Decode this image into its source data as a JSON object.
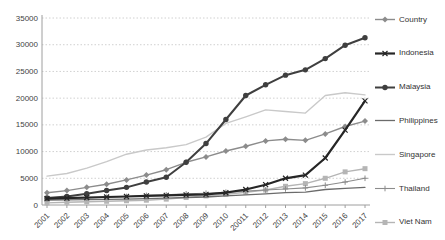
{
  "chart_data": {
    "type": "line",
    "title": "",
    "xlabel": "",
    "ylabel": "",
    "categories": [
      "2001",
      "2002",
      "2003",
      "2004",
      "2005",
      "2006",
      "2007",
      "2008",
      "2009",
      "2010",
      "20011",
      "2012",
      "2013",
      "2014",
      "2015",
      "2016",
      "2017"
    ],
    "yticks": [
      "0",
      "5000",
      "10000",
      "15000",
      "20000",
      "25000",
      "30000",
      "35000"
    ],
    "ylim": [
      0,
      35000
    ],
    "ytick_step": 5000,
    "grid": "horizontal-dotted",
    "legend_position": "right",
    "series": [
      {
        "name": "Country",
        "marker": "diamond",
        "color": "#8c8c8c",
        "width": 1.4,
        "values": [
          2300,
          2700,
          3300,
          3900,
          4700,
          5600,
          6600,
          8000,
          9000,
          10100,
          11000,
          12000,
          12300,
          12100,
          13300,
          14700,
          15700
        ]
      },
      {
        "name": "Indonesia",
        "marker": "x",
        "color": "#262626",
        "width": 2.2,
        "values": [
          1200,
          1300,
          1400,
          1500,
          1600,
          1700,
          1800,
          1900,
          2000,
          2300,
          2900,
          3800,
          5000,
          5600,
          8800,
          14000,
          19500
        ]
      },
      {
        "name": "Malaysia",
        "marker": "circle",
        "color": "#3f3f3f",
        "width": 2,
        "values": [
          1300,
          1600,
          2100,
          2700,
          3300,
          4300,
          5200,
          8000,
          11500,
          16000,
          20500,
          22500,
          24300,
          25300,
          27400,
          29900,
          31300
        ]
      },
      {
        "name": "Philippines",
        "marker": "none",
        "color": "#6b6b6b",
        "width": 1.3,
        "values": [
          900,
          950,
          1000,
          1050,
          1100,
          1200,
          1300,
          1400,
          1500,
          1700,
          1900,
          2100,
          2300,
          2400,
          2900,
          3100,
          3300
        ]
      },
      {
        "name": "Singapore",
        "marker": "none",
        "color": "#c9c9c9",
        "width": 1.4,
        "values": [
          5400,
          5900,
          6900,
          8100,
          9500,
          10300,
          10700,
          11300,
          12700,
          15300,
          16500,
          17800,
          17500,
          17200,
          20500,
          21000,
          20600
        ]
      },
      {
        "name": "Thailand",
        "marker": "plus",
        "color": "#8c8c8c",
        "width": 1.1,
        "values": [
          1100,
          1200,
          1300,
          1450,
          1600,
          1800,
          1900,
          2100,
          2200,
          2400,
          2600,
          2800,
          3000,
          3200,
          3700,
          4300,
          5000
        ]
      },
      {
        "name": "Viet Nam",
        "marker": "square",
        "color": "#b5b5b5",
        "width": 1.4,
        "values": [
          400,
          500,
          600,
          700,
          800,
          900,
          1100,
          1400,
          1700,
          2000,
          2400,
          2800,
          3500,
          4000,
          5000,
          6200,
          6800
        ]
      }
    ],
    "draw_order": [
      "Singapore",
      "Viet Nam",
      "Philippines",
      "Thailand",
      "Country",
      "Malaysia",
      "Indonesia"
    ]
  },
  "colors": {
    "background": "#ffffff",
    "gridline": "#c4c4c4",
    "axis": "#9e9e9e",
    "tick_label": "#3f3f3f",
    "legend_text": "#333333"
  }
}
